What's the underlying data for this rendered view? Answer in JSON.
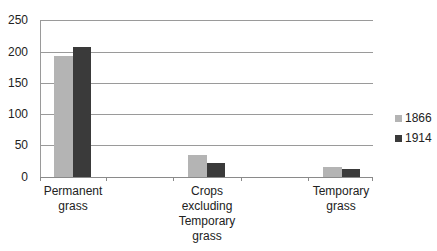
{
  "chart_data": {
    "type": "bar",
    "title": "",
    "xlabel": "",
    "ylabel": "",
    "ylim": [
      0,
      250
    ],
    "yticks": [
      "0",
      "50",
      "100",
      "150",
      "200",
      "250"
    ],
    "categories": [
      "Permanent grass",
      "Crops excluding Temporary grass",
      "Temporary grass"
    ],
    "category_label_lines": [
      [
        "Permanent",
        "grass"
      ],
      [
        "Crops",
        "excluding",
        "Temporary",
        "grass"
      ],
      [
        "Temporary",
        "grass"
      ]
    ],
    "series": [
      {
        "name": "1866",
        "color": "#b4b4b4",
        "values": [
          193,
          35,
          16
        ]
      },
      {
        "name": "1914",
        "color": "#3a3a3a",
        "values": [
          207,
          22,
          13
        ]
      }
    ],
    "grid": true,
    "legend_position": "right"
  },
  "legend": {
    "items": [
      {
        "label": "1866",
        "color": "#b4b4b4"
      },
      {
        "label": "1914",
        "color": "#3a3a3a"
      }
    ]
  }
}
